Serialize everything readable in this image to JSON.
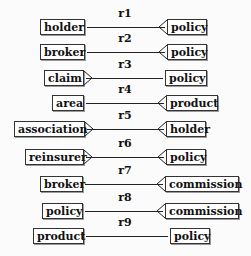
{
  "diagram": {
    "type": "entity-relationship",
    "relationships": [
      {
        "name": "r1",
        "left": "holder",
        "right": "policy",
        "left_many": false,
        "right_many": true
      },
      {
        "name": "r2",
        "left": "broker",
        "right": "policy",
        "left_many": false,
        "right_many": true
      },
      {
        "name": "r3",
        "left": "claim",
        "right": "policy",
        "left_many": true,
        "right_many": false
      },
      {
        "name": "r4",
        "left": "area",
        "right": "product",
        "left_many": false,
        "right_many": true
      },
      {
        "name": "r5",
        "left": "association",
        "right": "holder",
        "left_many": true,
        "right_many": true
      },
      {
        "name": "r6",
        "left": "reinsurer",
        "right": "policy",
        "left_many": true,
        "right_many": true
      },
      {
        "name": "r7",
        "left": "broker",
        "right": "commission",
        "left_many": false,
        "right_many": true
      },
      {
        "name": "r8",
        "left": "policy",
        "right": "commission",
        "left_many": false,
        "right_many": true
      },
      {
        "name": "r9",
        "left": "product",
        "right": "policy",
        "left_many": false,
        "right_many": false
      }
    ]
  }
}
